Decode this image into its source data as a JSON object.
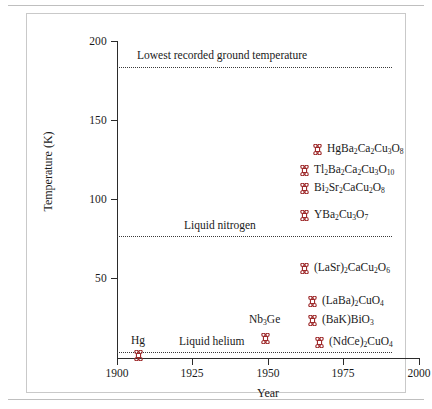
{
  "chart_data": {
    "type": "scatter",
    "title": "",
    "xlabel": "Year",
    "ylabel": "Temperature (K)",
    "xlim": [
      1900,
      2000
    ],
    "ylim": [
      0,
      205
    ],
    "xticks": [
      "1900",
      "1925",
      "1950",
      "1975",
      "2000"
    ],
    "xtick_values": [
      1900,
      1925,
      1950,
      1975,
      2000
    ],
    "yticks": [
      "50",
      "100",
      "150",
      "200"
    ],
    "ytick_values": [
      50,
      100,
      150,
      200
    ],
    "grid": false,
    "legend": "none",
    "marker_color": "#9e2a2b",
    "marker_name": "looped-square-marker",
    "reference_lines": [
      {
        "label": "Lowest recorded ground temperature",
        "value": 184,
        "style": "dotted"
      },
      {
        "label": "Liquid nitrogen",
        "value": 77,
        "style": "dotted"
      },
      {
        "label": "Liquid helium",
        "value": 4,
        "style": "dotted"
      }
    ],
    "points": [
      {
        "label": "Hg",
        "formula_html": "Hg",
        "x": 1911,
        "y": 4,
        "label_position": "above"
      },
      {
        "label": "Nb3Ge",
        "formula_html": "Nb<sub>3</sub>Ge",
        "x": 1967,
        "y": 23,
        "label_position": "above"
      },
      {
        "label": "(LaBa)2CuO4",
        "formula_html": "(LaBa)<sub>2</sub>CuO<sub>4</sub>",
        "x": 1986,
        "y": 38,
        "label_position": "right"
      },
      {
        "label": "(BaK)BiO3",
        "formula_html": "(BaK)BiO<sub>3</sub>",
        "x": 1988,
        "y": 30,
        "label_position": "right"
      },
      {
        "label": "(NdCe)2CuO4",
        "formula_html": "(NdCe)<sub>2</sub>CuO<sub>4</sub>",
        "x": 1989,
        "y": 22,
        "label_position": "right"
      },
      {
        "label": "(LaSr)2CaCu2O6",
        "formula_html": "(LaSr)<sub>2</sub>CaCu<sub>2</sub>O<sub>6</sub>",
        "x": 1986,
        "y": 60,
        "label_position": "right"
      },
      {
        "label": "YBa2Cu3O7",
        "formula_html": "YBa<sub>2</sub>Cu<sub>3</sub>O<sub>7</sub>",
        "x": 1987,
        "y": 93,
        "label_position": "right"
      },
      {
        "label": "Bi2Sr2CaCu2O8",
        "formula_html": "Bi<sub>2</sub>Sr<sub>2</sub>CaCu<sub>2</sub>O<sub>8</sub>",
        "x": 1987,
        "y": 110,
        "label_position": "right"
      },
      {
        "label": "Tl2Ba2Ca2Cu3O10",
        "formula_html": "Tl<sub>2</sub>Ba<sub>2</sub>Ca<sub>2</sub>Cu<sub>3</sub>O<sub>10</sub>",
        "x": 1988,
        "y": 122,
        "label_position": "right"
      },
      {
        "label": "HgBa2Ca2Cu3O8",
        "formula_html": "HgBa<sub>2</sub>Ca<sub>2</sub>Cu<sub>3</sub>O<sub>8</sub>",
        "x": 1993,
        "y": 135,
        "label_position": "right"
      }
    ]
  },
  "axes": {
    "ylabel": "Temperature (K)",
    "xlabel": "Year",
    "ytick_labels": [
      "200",
      "150",
      "100",
      "50"
    ],
    "xtick_labels": [
      "1900",
      "1925",
      "1950",
      "1975",
      "2000"
    ]
  },
  "reference_labels": {
    "ground": "Lowest recorded ground temperature",
    "nitrogen": "Liquid nitrogen",
    "helium": "Liquid helium"
  },
  "point_labels": {
    "hg": "Hg",
    "nb3ge": "Nb",
    "nb3ge_sub": "3",
    "nb3ge_tail": "Ge"
  }
}
